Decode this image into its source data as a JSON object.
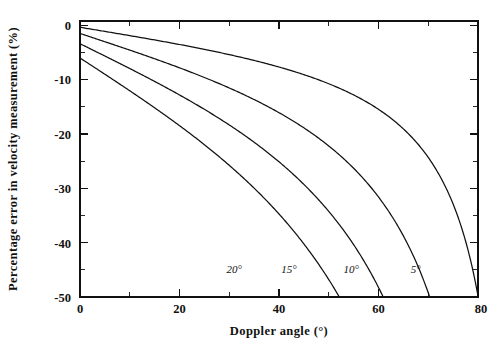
{
  "chart_data": {
    "type": "line",
    "title": "",
    "xlabel": "Doppler  angle  (°)",
    "ylabel": "Percentage error in velocity measurement (%)",
    "xlim": [
      0,
      80
    ],
    "ylim": [
      -50,
      0
    ],
    "grid": false,
    "legend_position": "inline-curve-labels",
    "xticks": [
      0,
      20,
      40,
      60,
      80
    ],
    "xticklabels": [
      "0",
      "20",
      "40",
      "60",
      "80"
    ],
    "xminorticks": [
      10,
      30,
      50,
      70
    ],
    "yticks": [
      0,
      -10,
      -20,
      -30,
      -40,
      -50
    ],
    "yticklabels": [
      "0",
      "-10",
      "-20",
      "-30",
      "-40",
      "-50"
    ],
    "yminorticks": [
      -5,
      -15,
      -25,
      -35,
      -45
    ],
    "x": [
      0,
      5,
      10,
      15,
      20,
      25,
      30,
      35,
      40,
      45,
      50,
      55,
      60,
      65,
      70,
      73,
      75
    ],
    "series": [
      {
        "name": "5°",
        "label": "5°",
        "angle_error_deg": 5,
        "label_x": 67.5,
        "label_y": -45.5,
        "crosses_minus50_at": 73.0,
        "values": [
          -0.38,
          -0.81,
          -1.32,
          -1.93,
          -2.68,
          -3.62,
          -4.82,
          -6.41,
          -8.55,
          -11.55,
          -15.91,
          -22.66,
          -33.8,
          -45.2,
          -50.0,
          -50.0,
          -50.0
        ]
      },
      {
        "name": "10°",
        "label": "10°",
        "angle_error_deg": 10,
        "label_x": 54.5,
        "label_y": -45.5,
        "crosses_minus50_at": 58.8,
        "values": [
          -1.52,
          -2.38,
          -3.38,
          -4.57,
          -6.03,
          -7.83,
          -10.12,
          -13.1,
          -17.1,
          -22.6,
          -30.5,
          -42.4,
          -50.0,
          -50.0,
          -50.0,
          -50.0,
          -50.0
        ]
      },
      {
        "name": "15°",
        "label": "15°",
        "angle_error_deg": 15,
        "label_x": 42.0,
        "label_y": -45.5,
        "crosses_minus50_at": 48.0,
        "values": [
          -3.41,
          -4.73,
          -6.26,
          -8.06,
          -10.24,
          -12.91,
          -16.3,
          -20.7,
          -26.5,
          -34.6,
          -46.2,
          -50.0,
          -50.0,
          -50.0,
          -50.0,
          -50.0,
          -50.0
        ]
      },
      {
        "name": "20°",
        "label": "20°",
        "angle_error_deg": 20,
        "label_x": 31.0,
        "label_y": -45.5,
        "crosses_minus50_at": 38.4,
        "values": [
          -6.03,
          -7.87,
          -9.99,
          -12.48,
          -15.48,
          -19.15,
          -23.8,
          -29.8,
          -37.8,
          -48.9,
          -50.0,
          -50.0,
          -50.0,
          -50.0,
          -50.0,
          -50.0,
          -50.0
        ]
      }
    ]
  }
}
